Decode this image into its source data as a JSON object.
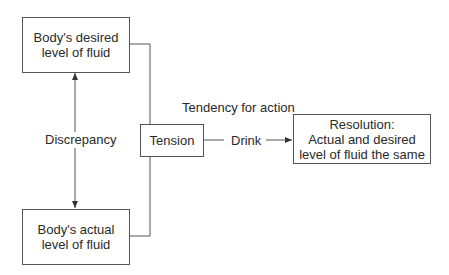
{
  "diagram": {
    "nodes": {
      "desired": {
        "lines": [
          "Body's desired",
          "level of fluid"
        ]
      },
      "actual": {
        "lines": [
          "Body's actual",
          "level of fluid"
        ]
      },
      "tension": {
        "label": "Tension"
      },
      "resolution": {
        "lines": [
          "Resolution:",
          "Actual and desired",
          "level of fluid the same"
        ]
      }
    },
    "labels": {
      "discrepancy": "Discrepancy",
      "tendency": "Tendency for action",
      "drink": "Drink"
    },
    "edges": [
      {
        "from": "actual",
        "to": "desired",
        "label": "Discrepancy",
        "type": "bidirectional"
      },
      {
        "from": "desired",
        "to": "tension",
        "type": "line"
      },
      {
        "from": "actual",
        "to": "tension",
        "type": "line"
      },
      {
        "from": "tension",
        "to": "resolution",
        "label": "Drink",
        "type": "arrow"
      }
    ],
    "colors": {
      "stroke": "#555555",
      "text": "#2a2a2a"
    }
  }
}
